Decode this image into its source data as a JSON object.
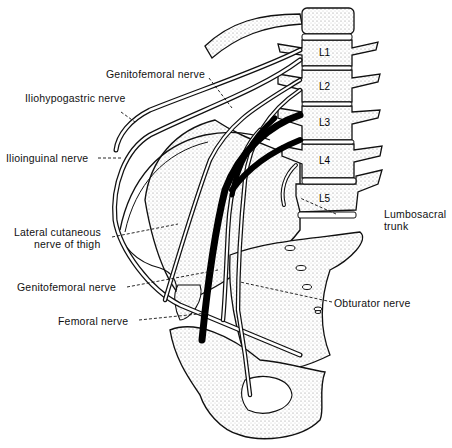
{
  "figure": {
    "vertebrae": [
      "L1",
      "L2",
      "L3",
      "L4",
      "L5"
    ],
    "labels": {
      "genitofemoral_top": "Genitofemoral nerve",
      "iliohypogastric": "Iliohypogastric nerve",
      "ilioinguinal": "Ilioinguinal nerve",
      "lateral_cutaneous_1": "Lateral cutaneous",
      "lateral_cutaneous_2": "nerve of thigh",
      "genitofemoral_bottom": "Genitofemoral nerve",
      "femoral": "Femoral nerve",
      "lumbosacral_1": "Lumbosacral",
      "lumbosacral_2": "trunk",
      "obturator": "Obturator nerve"
    }
  }
}
